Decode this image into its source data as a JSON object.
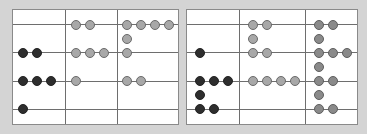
{
  "colors": {
    "dark": "#2e2e2e",
    "light": "#a8a8a8",
    "mid": "#8a8a8a",
    "background": "#d4d4d4"
  },
  "panels": [
    {
      "name": "left-panel",
      "rows": 4,
      "columns": 3,
      "dots": [
        {
          "col": 2,
          "row": 1,
          "count": 2,
          "color": "light"
        },
        {
          "col": 3,
          "row": 1,
          "count": 4,
          "color": "light"
        },
        {
          "col": 3,
          "row": 1.5,
          "count": 1,
          "color": "light"
        },
        {
          "col": 1,
          "row": 2,
          "count": 2,
          "color": "dark"
        },
        {
          "col": 2,
          "row": 2,
          "count": 3,
          "color": "light"
        },
        {
          "col": 3,
          "row": 2,
          "count": 1,
          "color": "light"
        },
        {
          "col": 1,
          "row": 3,
          "count": 3,
          "color": "dark"
        },
        {
          "col": 2,
          "row": 3,
          "count": 1,
          "color": "light"
        },
        {
          "col": 3,
          "row": 3,
          "count": 2,
          "color": "light"
        },
        {
          "col": 1,
          "row": 4,
          "count": 1,
          "color": "dark"
        }
      ]
    },
    {
      "name": "right-panel",
      "rows": 4,
      "columns": 3,
      "dots": [
        {
          "col": 2,
          "row": 1,
          "count": 2,
          "color": "light"
        },
        {
          "col": 3,
          "row": 1,
          "count": 2,
          "color": "mid"
        },
        {
          "col": 2,
          "row": 1.5,
          "count": 1,
          "color": "light"
        },
        {
          "col": 3,
          "row": 1.5,
          "count": 1,
          "color": "mid"
        },
        {
          "col": 1,
          "row": 2,
          "count": 1,
          "color": "dark"
        },
        {
          "col": 2,
          "row": 2,
          "count": 2,
          "color": "light"
        },
        {
          "col": 3,
          "row": 2,
          "count": 3,
          "color": "mid"
        },
        {
          "col": 3,
          "row": 2.5,
          "count": 1,
          "color": "mid"
        },
        {
          "col": 1,
          "row": 3,
          "count": 3,
          "color": "dark"
        },
        {
          "col": 2,
          "row": 3,
          "count": 4,
          "color": "light"
        },
        {
          "col": 3,
          "row": 3,
          "count": 2,
          "color": "mid"
        },
        {
          "col": 1,
          "row": 3.5,
          "count": 1,
          "color": "dark"
        },
        {
          "col": 3,
          "row": 3.5,
          "count": 1,
          "color": "mid"
        },
        {
          "col": 1,
          "row": 4,
          "count": 2,
          "color": "dark"
        },
        {
          "col": 3,
          "row": 4,
          "count": 2,
          "color": "mid"
        }
      ]
    }
  ]
}
